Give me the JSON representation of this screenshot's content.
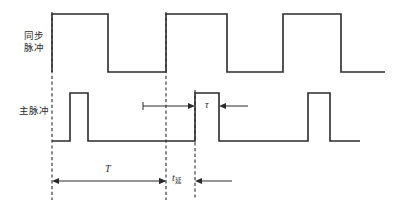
{
  "figure": {
    "title": "",
    "background_color": "#ffffff",
    "line_color": "#2b2b2b",
    "width": 395,
    "height": 216
  },
  "labels": {
    "sync_line1": "同步",
    "sync_line2": "脉冲",
    "main_pulse": "主脉冲",
    "tau": "τ",
    "period": "T",
    "delay_symbol": "t",
    "delay_subscript": "延"
  },
  "chart_data": {
    "type": "line",
    "title": "",
    "xlabel": "",
    "ylabel": "",
    "grid": false,
    "legend": "none",
    "annotations": [
      {
        "name": "sync-pulse-label",
        "text": "同步脉冲",
        "x": 34,
        "y": 41
      },
      {
        "name": "main-pulse-label",
        "text": "主脉冲",
        "x": 34,
        "y": 110
      },
      {
        "name": "tau-dimension",
        "text": "τ",
        "x": 208,
        "y": 105
      },
      {
        "name": "period-dimension",
        "text": "T",
        "x": 108,
        "y": 168
      },
      {
        "name": "delay-dimension",
        "text": "t延",
        "x": 178,
        "y": 178
      }
    ],
    "series": [
      {
        "name": "同步脉冲",
        "description": "Synchronization pulse train, rectangular, high during first portion of each period",
        "high_level": 14,
        "low_level": 72,
        "edges_px": [
          52,
          108,
          166,
          227,
          283,
          341
        ],
        "points": [
          [
            52,
            72
          ],
          [
            52,
            14
          ],
          [
            108,
            14
          ],
          [
            108,
            72
          ],
          [
            166,
            72
          ],
          [
            166,
            14
          ],
          [
            227,
            14
          ],
          [
            227,
            72
          ],
          [
            283,
            72
          ],
          [
            283,
            14
          ],
          [
            341,
            14
          ],
          [
            341,
            72
          ],
          [
            385,
            72
          ]
        ]
      },
      {
        "name": "主脉冲",
        "description": "Main (delayed) pulse train, narrow rectangular pulses delayed by t延 from each sync edge",
        "high_level": 93,
        "low_level": 141,
        "edges_px": [
          70,
          88,
          195,
          219,
          308,
          330
        ],
        "points": [
          [
            52,
            141
          ],
          [
            70,
            141
          ],
          [
            70,
            93
          ],
          [
            88,
            93
          ],
          [
            88,
            141
          ],
          [
            195,
            141
          ],
          [
            195,
            93
          ],
          [
            219,
            93
          ],
          [
            219,
            141
          ],
          [
            308,
            141
          ],
          [
            308,
            93
          ],
          [
            330,
            93
          ],
          [
            330,
            141
          ],
          [
            360,
            141
          ]
        ]
      }
    ],
    "reference_lines": [
      {
        "name": "sync-edge-1",
        "x": 52,
        "y1": 12,
        "y2": 200,
        "style": "dashed"
      },
      {
        "name": "sync-edge-2",
        "x": 166,
        "y1": 12,
        "y2": 200,
        "style": "dashed"
      },
      {
        "name": "main-edge-2",
        "x": 195,
        "y1": 90,
        "y2": 200,
        "style": "dashed"
      }
    ],
    "dimensions": [
      {
        "name": "period-T",
        "label": "T",
        "from_x": 52,
        "to_x": 166,
        "y": 181,
        "type": "double-arrow-inside"
      },
      {
        "name": "delay-t",
        "label": "t延",
        "from_x": 166,
        "to_x": 195,
        "y": 181,
        "type": "double-arrow-outside"
      },
      {
        "name": "pulse-width-tau",
        "label": "τ",
        "from_x": 195,
        "to_x": 219,
        "y": 106,
        "type": "double-arrow-outside"
      }
    ]
  }
}
